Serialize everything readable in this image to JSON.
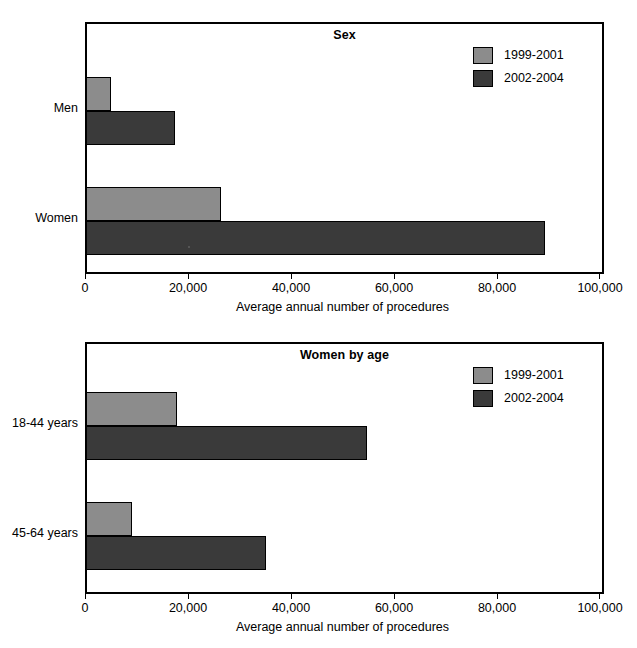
{
  "clipped_caption": "Figure 2. Average annual number of procedures",
  "legend": {
    "series": [
      {
        "label": "1999-2001",
        "color": "#8c8c8c"
      },
      {
        "label": "2002-2004",
        "color": "#3a3a3a"
      }
    ]
  },
  "axis": {
    "ticks": [
      "0",
      "20,000",
      "40,000",
      "60,000",
      "80,000",
      "100,000"
    ],
    "title": "Average annual number of procedures"
  },
  "panels": [
    {
      "title": "Sex",
      "categories": [
        "Men",
        "Women"
      ]
    },
    {
      "title": "Women by age",
      "categories": [
        "18-44 years",
        "45-64 years"
      ]
    }
  ],
  "chart_data": [
    {
      "type": "bar",
      "orientation": "horizontal",
      "title": "Sex",
      "xlabel": "Average annual number of procedures",
      "ylabel": "",
      "xlim": [
        0,
        100000
      ],
      "xticks": [
        0,
        20000,
        40000,
        60000,
        80000,
        100000
      ],
      "grid": false,
      "legend_position": "top-right",
      "categories": [
        "Men",
        "Women"
      ],
      "series": [
        {
          "name": "1999-2001",
          "color": "#8c8c8c",
          "values": [
            4700,
            26000
          ]
        },
        {
          "name": "2002-2004",
          "color": "#3a3a3a",
          "values": [
            17000,
            89000
          ]
        }
      ]
    },
    {
      "type": "bar",
      "orientation": "horizontal",
      "title": "Women by age",
      "xlabel": "Average annual number of procedures",
      "ylabel": "",
      "xlim": [
        0,
        100000
      ],
      "xticks": [
        0,
        20000,
        40000,
        60000,
        80000,
        100000
      ],
      "grid": false,
      "legend_position": "top-right",
      "categories": [
        "18-44 years",
        "45-64 years"
      ],
      "series": [
        {
          "name": "1999-2001",
          "color": "#8c8c8c",
          "values": [
            17500,
            8700
          ]
        },
        {
          "name": "2002-2004",
          "color": "#3a3a3a",
          "values": [
            54400,
            34800
          ]
        }
      ]
    }
  ]
}
